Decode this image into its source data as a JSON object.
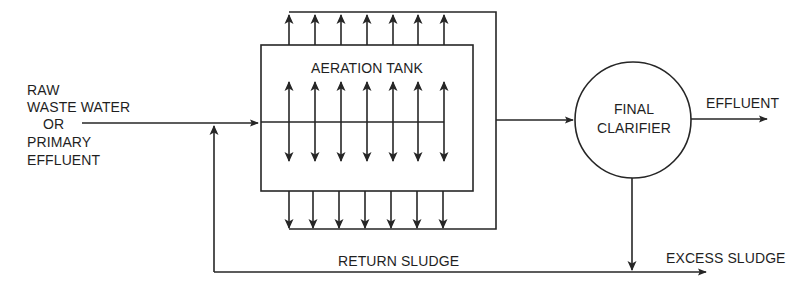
{
  "diagram": {
    "type": "activated sludge process flow",
    "colors": {
      "line": "#262626",
      "text": "#1f1f1f",
      "background": "#ffffff"
    },
    "labels": {
      "influent": [
        "RAW",
        "WASTE WATER",
        "OR",
        "PRIMARY",
        "EFFLUENT"
      ],
      "aeration_tank": "AERATION TANK",
      "clarifier": [
        "FINAL",
        "CLARIFIER"
      ],
      "effluent": "EFFLUENT",
      "return_sludge": "RETURN SLUDGE",
      "excess_sludge": "EXCESS SLUDGE"
    },
    "nodes": [
      {
        "id": "influent",
        "label": "RAW WASTE WATER OR PRIMARY EFFLUENT"
      },
      {
        "id": "aeration_tank",
        "label": "AERATION TANK",
        "shape": "rectangle"
      },
      {
        "id": "final_clarifier",
        "label": "FINAL CLARIFIER",
        "shape": "circle"
      },
      {
        "id": "effluent",
        "label": "EFFLUENT"
      },
      {
        "id": "excess_sludge",
        "label": "EXCESS SLUDGE"
      }
    ],
    "edges": [
      {
        "from": "influent",
        "to": "aeration_tank"
      },
      {
        "from": "aeration_tank",
        "to": "final_clarifier"
      },
      {
        "from": "final_clarifier",
        "to": "effluent"
      },
      {
        "from": "final_clarifier",
        "to": "excess_sludge"
      },
      {
        "from": "final_clarifier",
        "to": "aeration_tank",
        "label": "RETURN SLUDGE"
      }
    ],
    "aeration_columns": 7
  }
}
